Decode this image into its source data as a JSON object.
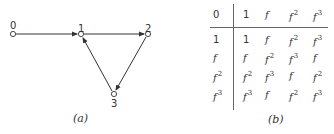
{
  "figure_a": {
    "caption": "(a)",
    "nodes": [
      {
        "id": "0",
        "label": "0",
        "x": 13,
        "y": 34
      },
      {
        "id": "1",
        "label": "1",
        "x": 81,
        "y": 34
      },
      {
        "id": "2",
        "label": "2",
        "x": 148,
        "y": 34
      },
      {
        "id": "3",
        "label": "3",
        "x": 114,
        "y": 94
      }
    ],
    "edges": [
      {
        "from": "0",
        "to": "1"
      },
      {
        "from": "1",
        "to": "2"
      },
      {
        "from": "2",
        "to": "3"
      },
      {
        "from": "3",
        "to": "1"
      }
    ]
  },
  "figure_b": {
    "caption": "(b)",
    "corner": "0",
    "col_headers": [
      "1",
      "f",
      "f2",
      "f3"
    ],
    "row_headers": [
      "1",
      "f",
      "f2",
      "f3"
    ],
    "rows": [
      [
        "1",
        "f",
        "f2",
        "f3"
      ],
      [
        "f",
        "f2",
        "f3",
        "f"
      ],
      [
        "f2",
        "f3",
        "f",
        "f2"
      ],
      [
        "f3",
        "f",
        "f2",
        "f3"
      ]
    ]
  }
}
